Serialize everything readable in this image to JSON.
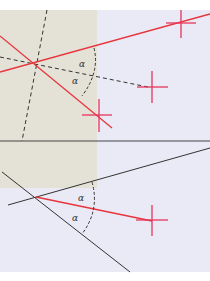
{
  "figure": {
    "top_panel": {
      "bg_left_color": "#e4e1d6",
      "bg_right_color": "#e9eaf5",
      "angle_labels": [
        "α",
        "α"
      ]
    },
    "bottom_panel": {
      "bg_top_color": "#e4e1d6",
      "bg_color": "#e9eaf5",
      "angle_labels": [
        "α",
        "α"
      ]
    },
    "colors": {
      "red_line": "#e8343c",
      "crosshair": "#e8345a",
      "black_line": "#333333",
      "divider": "#444444"
    }
  }
}
